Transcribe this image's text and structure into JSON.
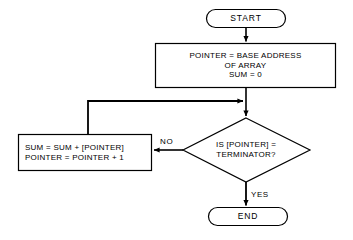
{
  "diagram": {
    "type": "flowchart",
    "background_color": "#ffffff",
    "stroke_color": "#000000",
    "fill_color": "#ffffff",
    "nodes": [
      {
        "id": "start",
        "shape": "terminator",
        "label": "START",
        "lines": [
          "START"
        ]
      },
      {
        "id": "init",
        "shape": "process",
        "label": "POINTER = BASE ADDRESS OF ARRAY SUM = 0",
        "lines": [
          "POINTER = BASE ADDRESS",
          "OF ARRAY",
          "SUM = 0"
        ]
      },
      {
        "id": "accumulate",
        "shape": "process",
        "label": "SUM = SUM + [POINTER] POINTER = POINTER + 1",
        "lines": [
          "SUM = SUM + [POINTER]",
          "POINTER = POINTER + 1"
        ]
      },
      {
        "id": "test",
        "shape": "decision",
        "label": "IS [POINTER] = TERMINATOR?",
        "lines": [
          "IS [POINTER] =",
          "TERMINATOR?"
        ]
      },
      {
        "id": "end",
        "shape": "terminator",
        "label": "END",
        "lines": [
          "END"
        ]
      }
    ],
    "edges": [
      {
        "id": "start-to-init",
        "from": "start",
        "to": "init",
        "label": ""
      },
      {
        "id": "init-to-test",
        "from": "init",
        "to": "test",
        "label": ""
      },
      {
        "id": "test-to-accumulate",
        "from": "test",
        "to": "accumulate",
        "label": "NO"
      },
      {
        "id": "accumulate-to-test",
        "from": "accumulate",
        "to": "test",
        "label": ""
      },
      {
        "id": "test-to-end",
        "from": "test",
        "to": "end",
        "label": "YES"
      }
    ],
    "labels": {
      "no": "NO",
      "yes": "YES"
    }
  }
}
